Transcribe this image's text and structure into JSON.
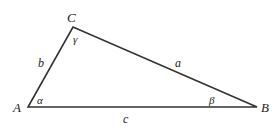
{
  "diagram": {
    "type": "triangle",
    "stroke_color": "#333333",
    "vertices": {
      "A": {
        "label": "A",
        "x": 28,
        "y": 107
      },
      "B": {
        "label": "B",
        "x": 257,
        "y": 107
      },
      "C": {
        "label": "C",
        "x": 73,
        "y": 27
      }
    },
    "sides": {
      "a": {
        "label": "a",
        "between": "B-C"
      },
      "b": {
        "label": "b",
        "between": "A-C"
      },
      "c": {
        "label": "c",
        "between": "A-B"
      }
    },
    "angles": {
      "alpha": {
        "label": "α",
        "at": "A"
      },
      "beta": {
        "label": "β",
        "at": "B"
      },
      "gamma": {
        "label": "γ",
        "at": "C"
      }
    }
  }
}
